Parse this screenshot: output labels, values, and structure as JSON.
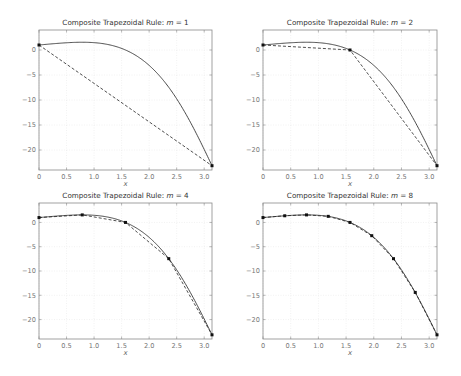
{
  "figure": {
    "function_label": "f(x) = e^x cos(x)",
    "xlabel": "x"
  },
  "chart_data": [
    {
      "type": "line",
      "title": "Composite Trapezoidal Rule: m = 1",
      "title_prefix": "Composite Trapezoidal Rule: ",
      "title_var": "m",
      "title_value": "= 1",
      "m": 1,
      "xlabel": "x",
      "ylabel": "",
      "xlim": [
        0,
        3.1416
      ],
      "ylim": [
        -24,
        4
      ],
      "xticks": [
        0,
        0.5,
        1.0,
        1.5,
        2.0,
        2.5,
        3.0
      ],
      "xtick_labels": [
        "0",
        "0.5",
        "1.0",
        "1.5",
        "2.0",
        "2.5",
        "3.0"
      ],
      "yticks": [
        0,
        -5,
        -10,
        -15,
        -20
      ],
      "ytick_labels": [
        "0",
        "−5",
        "−10",
        "−15",
        "−20"
      ],
      "grid": true,
      "series": [
        {
          "name": "f(x)",
          "style": "solid"
        },
        {
          "name": "trapezoid",
          "style": "dashed",
          "x": [
            0,
            3.1416
          ],
          "y": [
            1.0,
            -23.14
          ]
        }
      ]
    },
    {
      "type": "line",
      "title": "Composite Trapezoidal Rule: m = 2",
      "title_prefix": "Composite Trapezoidal Rule: ",
      "title_var": "m",
      "title_value": "= 2",
      "m": 2,
      "xlabel": "x",
      "ylabel": "",
      "xlim": [
        0,
        3.1416
      ],
      "ylim": [
        -24,
        4
      ],
      "xticks": [
        0,
        0.5,
        1.0,
        1.5,
        2.0,
        2.5,
        3.0
      ],
      "xtick_labels": [
        "0",
        "0.5",
        "1.0",
        "1.5",
        "2.0",
        "2.5",
        "3.0"
      ],
      "yticks": [
        0,
        -5,
        -10,
        -15,
        -20
      ],
      "ytick_labels": [
        "0",
        "−5",
        "−10",
        "−15",
        "−20"
      ],
      "grid": true,
      "series": [
        {
          "name": "f(x)",
          "style": "solid"
        },
        {
          "name": "trapezoid",
          "style": "dashed",
          "x": [
            0,
            1.5708,
            3.1416
          ],
          "y": [
            1.0,
            0.0,
            -23.14
          ]
        }
      ]
    },
    {
      "type": "line",
      "title": "Composite Trapezoidal Rule: m = 4",
      "title_prefix": "Composite Trapezoidal Rule: ",
      "title_var": "m",
      "title_value": "= 4",
      "m": 4,
      "xlabel": "x",
      "ylabel": "",
      "xlim": [
        0,
        3.1416
      ],
      "ylim": [
        -24,
        4
      ],
      "xticks": [
        0,
        0.5,
        1.0,
        1.5,
        2.0,
        2.5,
        3.0
      ],
      "xtick_labels": [
        "0",
        "0.5",
        "1.0",
        "1.5",
        "2.0",
        "2.5",
        "3.0"
      ],
      "yticks": [
        0,
        -5,
        -10,
        -15,
        -20
      ],
      "ytick_labels": [
        "0",
        "−5",
        "−10",
        "−15",
        "−20"
      ],
      "grid": true,
      "series": [
        {
          "name": "f(x)",
          "style": "solid"
        },
        {
          "name": "trapezoid",
          "style": "dashed",
          "x": [
            0,
            0.7854,
            1.5708,
            2.3562,
            3.1416
          ],
          "y": [
            1.0,
            1.55,
            0.0,
            -7.46,
            -23.14
          ]
        }
      ]
    },
    {
      "type": "line",
      "title": "Composite Trapezoidal Rule: m = 8",
      "title_prefix": "Composite Trapezoidal Rule: ",
      "title_var": "m",
      "title_value": "= 8",
      "m": 8,
      "xlabel": "x",
      "ylabel": "",
      "xlim": [
        0,
        3.1416
      ],
      "ylim": [
        -24,
        4
      ],
      "xticks": [
        0,
        0.5,
        1.0,
        1.5,
        2.0,
        2.5,
        3.0
      ],
      "xtick_labels": [
        "0",
        "0.5",
        "1.0",
        "1.5",
        "2.0",
        "2.5",
        "3.0"
      ],
      "yticks": [
        0,
        -5,
        -10,
        -15,
        -20
      ],
      "ytick_labels": [
        "0",
        "−5",
        "−10",
        "−15",
        "−20"
      ],
      "grid": true,
      "series": [
        {
          "name": "f(x)",
          "style": "solid"
        },
        {
          "name": "trapezoid",
          "style": "dashed",
          "x": [
            0,
            0.3927,
            0.7854,
            1.1781,
            1.5708,
            1.9635,
            2.3562,
            2.7489,
            3.1416
          ],
          "y": [
            1.0,
            1.37,
            1.55,
            1.25,
            0.0,
            -2.73,
            -7.46,
            -14.41,
            -23.14
          ]
        }
      ]
    }
  ],
  "layout": {
    "panels": [
      {
        "left": 39,
        "top": 30,
        "right": 212,
        "bottom": 170
      },
      {
        "left": 263,
        "top": 30,
        "right": 437,
        "bottom": 170
      },
      {
        "left": 39,
        "top": 203,
        "right": 212,
        "bottom": 339
      },
      {
        "left": 263,
        "top": 203,
        "right": 437,
        "bottom": 339
      }
    ]
  }
}
